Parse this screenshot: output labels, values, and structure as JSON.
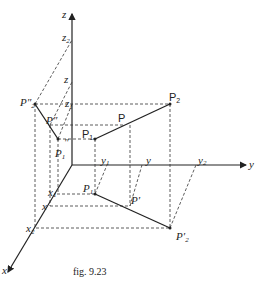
{
  "figure": {
    "caption": "fig. 9.23",
    "axes": {
      "x_label": "x",
      "y_label": "y",
      "z_label": "z"
    },
    "axis_ticks": {
      "z": [
        "z",
        "2",
        "z",
        "z",
        "1"
      ],
      "z_labels": {
        "z2_main": "z",
        "z2_sub": "2",
        "z_mid": "z",
        "z1_main": "z",
        "z1_sub": "1"
      },
      "y_labels": {
        "y1_main": "y",
        "y1_sub": "1",
        "y_mid": "y",
        "y2_main": "y",
        "y2_sub": "2"
      },
      "x_labels": {
        "x1_main": "x",
        "x1_sub": "1",
        "x_mid": "x",
        "x2_main": "x",
        "x2_sub": "2"
      }
    },
    "points": {
      "P2": {
        "main": "P",
        "sub": "2"
      },
      "P": {
        "main": "P"
      },
      "P1": {
        "main": "P",
        "sub": "1"
      },
      "P2_yz": {
        "main": "P″",
        "sub": "2"
      },
      "P_yz": {
        "main": "P″"
      },
      "P1_yz": {
        "main": "P",
        "sub": "1",
        "sup": "″"
      },
      "P1_xy": {
        "main": "P",
        "sub": "1"
      },
      "P_xy": {
        "main": "P′"
      },
      "P2_xy": {
        "main": "P′",
        "sub": "2"
      }
    }
  }
}
